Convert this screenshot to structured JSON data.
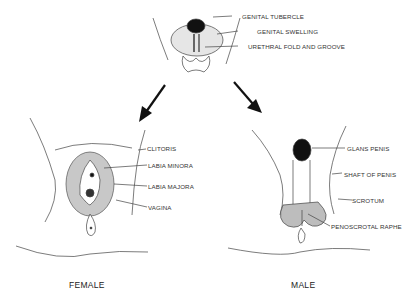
{
  "diagram": {
    "indifferent": {
      "labels": [
        "GENITAL TUBERCLE",
        "GENITAL SWELLING",
        "URETHRAL FOLD AND GROOVE"
      ]
    },
    "female": {
      "caption": "FEMALE",
      "labels": [
        "CLITORIS",
        "LABIA MINORA",
        "LABIA MAJORA",
        "VAGINA"
      ]
    },
    "male": {
      "caption": "MALE",
      "labels": [
        "GLANS PENIS",
        "SHAFT OF PENIS",
        "SCROTUM",
        "PENOSCROTAL RAPHE"
      ]
    },
    "colors": {
      "ink": "#222222",
      "shade": "#b8b8b8",
      "background": "#ffffff"
    }
  }
}
